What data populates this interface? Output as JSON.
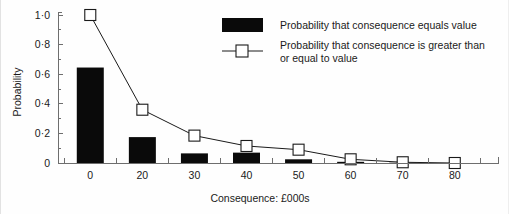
{
  "chart_data": {
    "type": "bar",
    "title": "",
    "xlabel": "Consequence: £000s",
    "ylabel": "Probability",
    "categories": [
      "0",
      "20",
      "30",
      "40",
      "50",
      "60",
      "70",
      "80"
    ],
    "x_tick_labels": [
      "0",
      "20",
      "30",
      "40",
      "50",
      "60",
      "70",
      "80"
    ],
    "y_tick_labels": [
      "0",
      "0·2",
      "0·4",
      "0·6",
      "0·8",
      "1·0"
    ],
    "y_tick_values": [
      0,
      0.2,
      0.4,
      0.6,
      0.8,
      1.0
    ],
    "ylim": [
      0,
      1.0
    ],
    "grid": false,
    "legend_position": "top-right",
    "series": [
      {
        "name": "Probability that consequence equals value",
        "type": "bar",
        "marker": "filled-rectangle",
        "color": "#0a0a0a",
        "values": [
          0.645,
          0.175,
          0.065,
          0.07,
          0.025,
          0.008,
          0.002,
          0.0
        ]
      },
      {
        "name": "Probability that consequence is greater than or equal to value",
        "type": "line",
        "marker": "open-square",
        "color": "#1a1a1a",
        "values": [
          1.0,
          0.36,
          0.185,
          0.115,
          0.09,
          0.025,
          0.005,
          0.0
        ]
      }
    ]
  },
  "legend": {
    "entries": [
      {
        "label": "Probability that consequence equals value",
        "swatch": "filled-rectangle"
      },
      {
        "label_line1": "Probability that consequence is greater than",
        "label_line2": "or equal to value",
        "swatch": "line-with-open-square"
      }
    ]
  },
  "colors": {
    "bar": "#0a0a0a",
    "line": "#1a1a1a",
    "marker_fill": "#ffffff",
    "axis": "#6e6e6e",
    "text": "#1a1a1a",
    "background": "#fefefe"
  }
}
